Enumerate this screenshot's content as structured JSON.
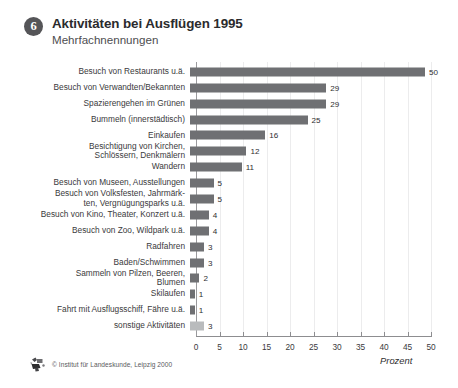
{
  "header": {
    "badge_number": "6",
    "title": "Aktivitäten bei Ausflügen 1995",
    "subtitle": "Mehrfachnennungen"
  },
  "footer": {
    "logo_icon": "institute-logo-icon",
    "credit": "© Institut für Landeskunde, Leipzig 2000"
  },
  "chart_data": {
    "type": "bar",
    "orientation": "horizontal",
    "title": "Aktivitäten bei Ausflügen 1995",
    "subtitle": "Mehrfachnennungen",
    "xlabel": "Prozent",
    "ylabel": "",
    "xlim": [
      0,
      50
    ],
    "xticks": [
      0,
      5,
      10,
      15,
      20,
      25,
      30,
      35,
      40,
      45,
      50
    ],
    "xtick_labels": [
      "0",
      "5",
      "10",
      "15",
      "20",
      "25",
      "30",
      "35",
      "40",
      "45",
      "50"
    ],
    "grid": true,
    "legend": false,
    "bar_color": "#6f7073",
    "highlight_color": "#b9bbbd",
    "categories": [
      "Besuch von Restaurants u.ä.",
      "Besuch von Verwandten/Bekannten",
      "Spazierengehen im Grünen",
      "Bummeln (innerstädtisch)",
      "Einkaufen",
      "Besichtigung von Kirchen,\nSchlössern, Denkmälern",
      "Wandern",
      "Besuch von Museen, Ausstellungen",
      "Besuch von Volksfesten, Jahrmärk-\nten, Vergnügungsparks u.ä.",
      "Besuch von Kino, Theater, Konzert u.ä.",
      "Besuch von Zoo, Wildpark u.ä.",
      "Radfahren",
      "Baden/Schwimmen",
      "Sammeln von Pilzen, Beeren,\nBlumen",
      "Skilaufen",
      "Fahrt mit Ausflugsschiff, Fähre u.ä.",
      "sonstige Aktivitäten"
    ],
    "values": [
      50,
      29,
      29,
      25,
      16,
      12,
      11,
      5,
      5,
      4,
      4,
      3,
      3,
      2,
      1,
      1,
      3
    ],
    "value_labels": [
      "50",
      "29",
      "29",
      "25",
      "16",
      "12",
      "11",
      "5",
      "5",
      "4",
      "4",
      "3",
      "3",
      "2",
      "1",
      "1",
      "3"
    ],
    "highlight_index": 16
  }
}
